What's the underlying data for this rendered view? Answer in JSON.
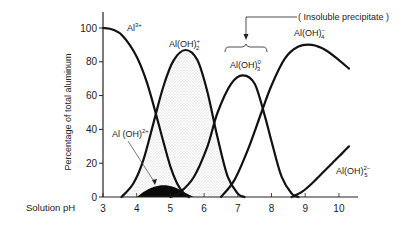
{
  "chart_data": {
    "type": "line",
    "title": "",
    "xlabel": "Solution pH",
    "ylabel": "Percentage of total aluminum",
    "xlim": [
      3,
      10.5
    ],
    "ylim": [
      0,
      100
    ],
    "x_ticks": [
      3,
      4,
      5,
      6,
      7,
      8,
      9,
      10
    ],
    "y_ticks": [
      0,
      20,
      40,
      60,
      80,
      100
    ],
    "grid": false,
    "legend": "inline labels",
    "series": [
      {
        "name": "Al3+",
        "label_main": "Al",
        "label_sup": "3+",
        "label_sub": "",
        "fill": "none",
        "points": [
          [
            3.0,
            100
          ],
          [
            3.3,
            99
          ],
          [
            3.6,
            95
          ],
          [
            4.0,
            83
          ],
          [
            4.3,
            68
          ],
          [
            4.6,
            47
          ],
          [
            4.8,
            32
          ],
          [
            5.0,
            18
          ],
          [
            5.2,
            8
          ],
          [
            5.4,
            2
          ],
          [
            5.55,
            0
          ]
        ]
      },
      {
        "name": "Al(OH)2+",
        "label_main": "Al(OH)",
        "label_sup": "2+",
        "label_sub": "",
        "fill": "black",
        "points": [
          [
            4.0,
            0
          ],
          [
            4.2,
            3
          ],
          [
            4.5,
            6
          ],
          [
            4.8,
            7
          ],
          [
            5.1,
            6
          ],
          [
            5.4,
            3
          ],
          [
            5.7,
            0
          ]
        ]
      },
      {
        "name": "Al(OH)2+ (dihydroxy)",
        "label_main": "Al(OH)",
        "label_sup": "+",
        "label_sub": "2",
        "fill": "stipple",
        "points": [
          [
            3.55,
            0
          ],
          [
            3.9,
            8
          ],
          [
            4.2,
            22
          ],
          [
            4.5,
            44
          ],
          [
            4.8,
            66
          ],
          [
            5.1,
            81
          ],
          [
            5.45,
            87
          ],
          [
            5.8,
            81
          ],
          [
            6.1,
            62
          ],
          [
            6.4,
            35
          ],
          [
            6.7,
            12
          ],
          [
            7.0,
            2
          ],
          [
            7.2,
            0
          ]
        ]
      },
      {
        "name": "Al(OH)3 0",
        "label_main": "Al(OH)",
        "label_sup": "0",
        "label_sub": "3",
        "fill": "none",
        "points": [
          [
            5.0,
            0
          ],
          [
            5.3,
            3
          ],
          [
            5.7,
            12
          ],
          [
            6.1,
            30
          ],
          [
            6.4,
            50
          ],
          [
            6.8,
            67
          ],
          [
            7.15,
            72
          ],
          [
            7.5,
            67
          ],
          [
            7.8,
            48
          ],
          [
            8.0,
            33
          ],
          [
            8.3,
            12
          ],
          [
            8.6,
            2
          ],
          [
            8.8,
            0
          ]
        ]
      },
      {
        "name": "Al(OH)4-",
        "label_main": "Al(OH)",
        "label_sup": "−",
        "label_sub": "4",
        "fill": "none",
        "points": [
          [
            6.5,
            0
          ],
          [
            6.9,
            10
          ],
          [
            7.3,
            28
          ],
          [
            7.7,
            50
          ],
          [
            8.0,
            66
          ],
          [
            8.4,
            82
          ],
          [
            8.8,
            89
          ],
          [
            9.2,
            90
          ],
          [
            9.6,
            87
          ],
          [
            10.0,
            81
          ],
          [
            10.3,
            76
          ]
        ]
      },
      {
        "name": "Al(OH)5 2-",
        "label_main": "Al(OH)",
        "label_sup": "2−",
        "label_sub": "5",
        "fill": "none",
        "points": [
          [
            8.6,
            0
          ],
          [
            8.9,
            3
          ],
          [
            9.2,
            8
          ],
          [
            9.5,
            14
          ],
          [
            9.8,
            20
          ],
          [
            10.1,
            26
          ],
          [
            10.3,
            30
          ]
        ]
      }
    ],
    "annotations": [
      {
        "text": "( Insoluble precipitate )",
        "points_to": "Al(OH)3 0"
      },
      {
        "text": "Al(OH)2+ arrow",
        "points_to": "black filled region"
      }
    ]
  },
  "labels": {
    "y_axis_title": "Percentage of total aluminum",
    "x_axis_title": "Solution pH",
    "insoluble": "( Insoluble precipitate )",
    "al3": "Al",
    "al3_sup": "3+",
    "aloh2plus": "Al(OH)",
    "aloh2plus_sup": "+",
    "aloh2plus_sub": "2",
    "aloh_2plus": "Al (OH)",
    "aloh_2plus_sup": "2+",
    "aloh3": "Al(OH)",
    "aloh3_sup": "0",
    "aloh3_sub": "3",
    "aloh4": "Al(OH)",
    "aloh4_sup": "−",
    "aloh4_sub": "4",
    "aloh5": "Al(OH)",
    "aloh5_sup": "2−",
    "aloh5_sub": "5"
  }
}
